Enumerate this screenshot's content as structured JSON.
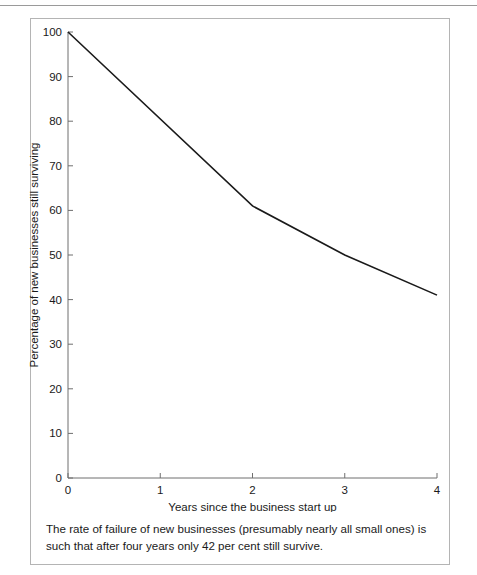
{
  "figure": {
    "caption": "The rate of failure of new businesses (presumably nearly all small ones) is such that after four years only 42 per cent still survive."
  },
  "chart_data": {
    "type": "line",
    "title": "",
    "xlabel": "Years since the business start up",
    "ylabel": "Percentage of new businesses still surviving",
    "x": [
      0,
      2,
      3,
      4
    ],
    "values": [
      100,
      61,
      50,
      41
    ],
    "series": [
      {
        "name": "Percentage of new businesses still surviving",
        "x": [
          0,
          2,
          3,
          4
        ],
        "values": [
          100,
          61,
          50,
          41
        ]
      }
    ],
    "xlim": [
      0,
      4
    ],
    "ylim": [
      0,
      100
    ],
    "xticks": [
      "0",
      "1",
      "2",
      "3",
      "4"
    ],
    "yticks": [
      "0",
      "10",
      "20",
      "30",
      "40",
      "50",
      "60",
      "70",
      "80",
      "90",
      "100"
    ],
    "grid": false,
    "legend": "none",
    "line_color": "#1a1a1a"
  }
}
